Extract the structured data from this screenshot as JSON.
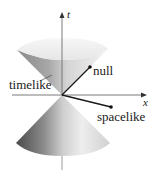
{
  "diagram": {
    "axes": {
      "time": {
        "label": "t"
      },
      "space": {
        "label": "x"
      }
    },
    "labels": {
      "timelike": "timelike",
      "null": "null",
      "spacelike": "spacelike"
    },
    "colors": {
      "background": "#ffffff",
      "axis": "#7a7a7a",
      "vector": "#1a1a1a",
      "cone_dark": "#5a5a5a",
      "cone_light": "#f2f2f2"
    }
  }
}
